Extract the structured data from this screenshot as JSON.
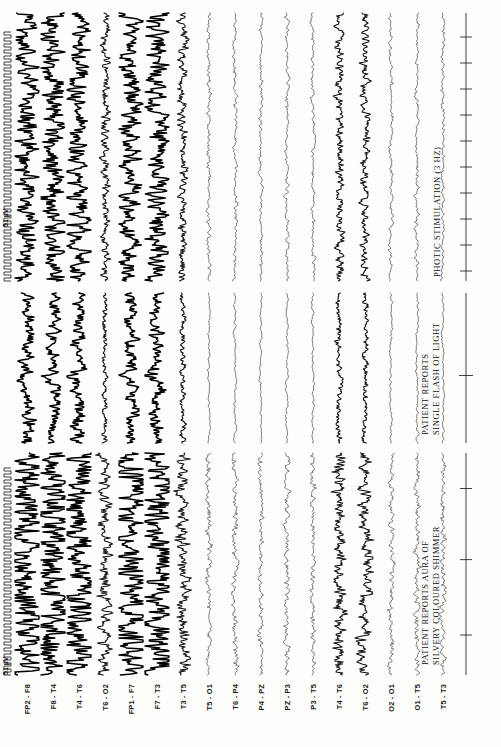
{
  "document": {
    "title": "EEG Recording — Photic Stimulation Study",
    "paper_color": "#fdfdfc",
    "trace_color": "#171717",
    "orientation": "rotated-90",
    "panel_count": 3
  },
  "calibration": {
    "label_left": "51 µV",
    "label_right": "51 µV",
    "unit": "µV",
    "amplitude": "51"
  },
  "channels": [
    {
      "id": "ch1",
      "label": "FP2 - F8",
      "weight": "heavy"
    },
    {
      "id": "ch2",
      "label": "F8 - T4",
      "weight": "heavy"
    },
    {
      "id": "ch3",
      "label": "T4 - T6",
      "weight": "heavy"
    },
    {
      "id": "ch4",
      "label": "T6 - O2",
      "weight": "mid"
    },
    {
      "id": "ch5",
      "label": "FP1 - F7",
      "weight": "heavy"
    },
    {
      "id": "ch6",
      "label": "F7 - T3",
      "weight": "heavy"
    },
    {
      "id": "ch7",
      "label": "T3 - T5",
      "weight": "mid"
    },
    {
      "id": "ch8",
      "label": "T5 - O1",
      "weight": "light"
    },
    {
      "id": "ch9",
      "label": "T6 - P4",
      "weight": "light"
    },
    {
      "id": "ch10",
      "label": "P4 - PZ",
      "weight": "light"
    },
    {
      "id": "ch11",
      "label": "PZ - P3",
      "weight": "light"
    },
    {
      "id": "ch12",
      "label": "P3 - T5",
      "weight": "light"
    },
    {
      "id": "ch13",
      "label": "T4 - T6",
      "weight": "mid"
    },
    {
      "id": "ch14",
      "label": "T6 - O2",
      "weight": "mid"
    },
    {
      "id": "ch15",
      "label": "O2 - O1",
      "weight": "light"
    },
    {
      "id": "ch16",
      "label": "O1 - T5",
      "weight": "light"
    },
    {
      "id": "ch17",
      "label": "T5 - T3",
      "weight": "light"
    }
  ],
  "annotations": [
    {
      "id": "annot-aura",
      "line1": "PATIENT REPORTS AURA OF",
      "line2": "SILVERY COLOURED SHIMMER",
      "panel": 1
    },
    {
      "id": "annot-flash",
      "line1": "PATIENT REPORTS",
      "line2": "SINGLE FLASH OF LIGHT",
      "panel": 2
    },
    {
      "id": "annot-photic",
      "line1": "PHOTIC STIMULATION (3 HZ)",
      "line2": "",
      "panel": 3
    }
  ],
  "chart_data": {
    "type": "line",
    "xlabel": "Time",
    "ylabel": "Channel (bipolar montage)",
    "grid": false,
    "legend_position": "none",
    "amplitude_scale_uv": 51,
    "panels": [
      {
        "name": "panel-1",
        "label": "baseline / aura onset"
      },
      {
        "name": "panel-2",
        "label": "single flash of light"
      },
      {
        "name": "panel-3",
        "label": "photic stimulation 3 Hz"
      }
    ],
    "channel_order": [
      "FP2 - F8",
      "F8 - T4",
      "T4 - T6",
      "T6 - O2",
      "FP1 - F7",
      "F7 - T3",
      "T3 - T5",
      "T5 - O1",
      "T6 - P4",
      "P4 - PZ",
      "PZ - P3",
      "P3 - T5",
      "T4 - T6",
      "T6 - O2",
      "O2 - O1",
      "O1 - T5",
      "T5 - T3"
    ],
    "events": [
      {
        "panel": 1,
        "text": "PATIENT REPORTS AURA OF SILVERY COLOURED SHIMMER"
      },
      {
        "panel": 2,
        "text": "PATIENT REPORTS SINGLE FLASH OF LIGHT"
      },
      {
        "panel": 3,
        "text": "PHOTIC STIMULATION (3 HZ)"
      }
    ],
    "stimulation_frequency_hz": 3
  }
}
